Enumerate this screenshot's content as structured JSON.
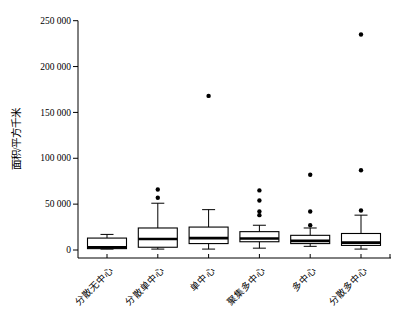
{
  "figure": {
    "background": "#ffffff",
    "kind": "box-and-whisker plot"
  },
  "chart_data": {
    "type": "boxplot",
    "title": "",
    "xlabel": "",
    "ylabel": "面积/平方千米",
    "ylim": [
      0,
      250000
    ],
    "ytick_interval": 50000,
    "ytick_values": [
      0,
      50000,
      100000,
      150000,
      200000,
      250000
    ],
    "ytick_labels": [
      "0",
      "50 000",
      "100 000",
      "150 000",
      "200 000",
      "250 000"
    ],
    "grid": false,
    "legend": false,
    "categories": [
      "分散无中心",
      "分散单中心",
      "单中心",
      "聚集多中心",
      "多中心",
      "分散多中心"
    ],
    "series": [
      {
        "category": "分散无中心",
        "whisker_low": 1000,
        "q1": 1500,
        "median": 3000,
        "q3": 13000,
        "whisker_high": 17000,
        "outliers": []
      },
      {
        "category": "分散单中心",
        "whisker_low": 1000,
        "q1": 3000,
        "median": 12000,
        "q3": 24000,
        "whisker_high": 51000,
        "outliers": [
          57000,
          66000
        ]
      },
      {
        "category": "单中心",
        "whisker_low": 1000,
        "q1": 7000,
        "median": 13000,
        "q3": 25000,
        "whisker_high": 44000,
        "outliers": [
          168000
        ]
      },
      {
        "category": "聚集多中心",
        "whisker_low": 2000,
        "q1": 9000,
        "median": 12500,
        "q3": 20000,
        "whisker_high": 27000,
        "outliers": [
          38000,
          42000,
          54000,
          65000
        ]
      },
      {
        "category": "多中心",
        "whisker_low": 4000,
        "q1": 7000,
        "median": 10000,
        "q3": 16000,
        "whisker_high": 24000,
        "outliers": [
          27000,
          42000,
          82000
        ]
      },
      {
        "category": "分散多中心",
        "whisker_low": 1000,
        "q1": 5000,
        "median": 8000,
        "q3": 18000,
        "whisker_high": 38000,
        "outliers": [
          43000,
          87000,
          235000
        ]
      }
    ],
    "colors": {
      "box_fill": "#ffffff",
      "line": "#000000",
      "median": "#000000",
      "outlier": "#000000",
      "background": "#ffffff"
    }
  }
}
